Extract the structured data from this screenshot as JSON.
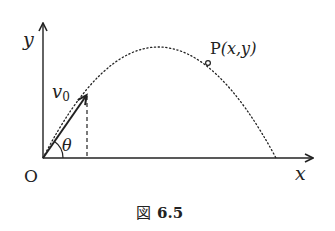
{
  "figure": {
    "caption_prefix": "図",
    "caption_number": "6.5"
  },
  "axes": {
    "x_label": "x",
    "y_label": "y",
    "origin_label": "O"
  },
  "labels": {
    "velocity": "v",
    "velocity_sub": "0",
    "angle": "θ",
    "point_name": "P",
    "point_coords": "(x,y)"
  },
  "colors": {
    "ink": "#222222",
    "background": "#ffffff"
  }
}
